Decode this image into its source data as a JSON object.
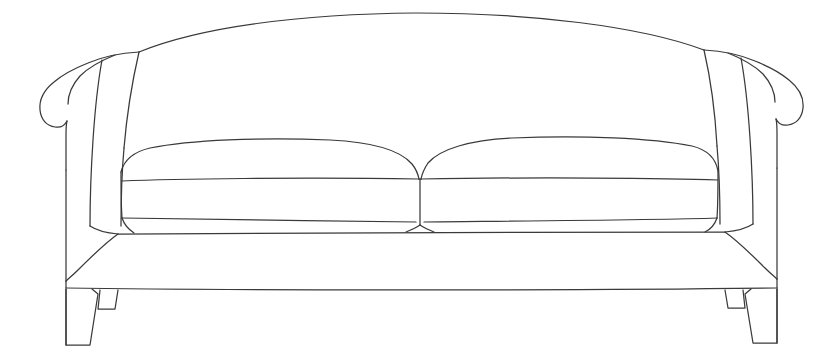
{
  "document": {
    "type": "line-drawing",
    "subject": "sofa",
    "title": "Two-seat curved-back sofa line drawing",
    "background_color": "#ffffff",
    "line_color": "#3a3a3c",
    "line_width_px": 1.25,
    "canvas": {
      "width": 831,
      "height": 361
    }
  },
  "parts": [
    {
      "id": "backrest",
      "name": "Curved back",
      "description": "Tall bowed seat back arcing from left arm top to right arm top, apex near center-top of frame",
      "apex": {
        "x": 415,
        "y": 15
      },
      "left_end": {
        "x": 140,
        "y": 50
      },
      "right_end": {
        "x": 700,
        "y": 48
      }
    },
    {
      "id": "left-arm",
      "name": "Left rolled arm",
      "description": "Outward-scrolled arm with rolled top, inner roll crease and vertical outer face",
      "bounds": {
        "x": 40,
        "y": 52,
        "width": 100,
        "height": 230
      }
    },
    {
      "id": "right-arm",
      "name": "Right rolled arm",
      "description": "Mirror of left arm, outward-scrolled with rolled top and vertical outer face",
      "bounds": {
        "x": 690,
        "y": 50,
        "width": 100,
        "height": 230
      }
    },
    {
      "id": "left-cushion",
      "name": "Left seat cushion",
      "description": "Rounded-top boxed seat cushion, left of center split",
      "bounds": {
        "x": 120,
        "y": 138,
        "width": 300,
        "height": 90
      }
    },
    {
      "id": "right-cushion",
      "name": "Right seat cushion",
      "description": "Rounded-top boxed seat cushion, right of center split",
      "bounds": {
        "x": 420,
        "y": 136,
        "width": 295,
        "height": 90
      }
    },
    {
      "id": "cushion-split",
      "name": "Centre cushion split",
      "description": "Vertical seam where the two seat cushions meet",
      "x": 420
    },
    {
      "id": "base-skirt",
      "name": "Base rail / skirt",
      "description": "Wide tapered base band below the seat cushions, flaring outward at both ends",
      "top_y": 228,
      "bottom_y": 290
    },
    {
      "id": "left-front-leg",
      "name": "Left front leg",
      "description": "Tapered splayed block leg at front-left corner",
      "bounds": {
        "x": 58,
        "y": 290,
        "width": 40,
        "height": 55
      }
    },
    {
      "id": "left-rear-leg",
      "name": "Left rear leg",
      "description": "Small partially hidden rear leg stub behind the left front leg",
      "bounds": {
        "x": 95,
        "y": 290,
        "width": 22,
        "height": 16
      }
    },
    {
      "id": "right-front-leg",
      "name": "Right front leg",
      "description": "Tapered splayed block leg at front-right corner",
      "bounds": {
        "x": 735,
        "y": 290,
        "width": 40,
        "height": 55
      }
    },
    {
      "id": "right-rear-leg",
      "name": "Right rear leg",
      "description": "Small partially hidden rear leg stub behind the right front leg",
      "bounds": {
        "x": 715,
        "y": 290,
        "width": 22,
        "height": 16
      }
    }
  ]
}
